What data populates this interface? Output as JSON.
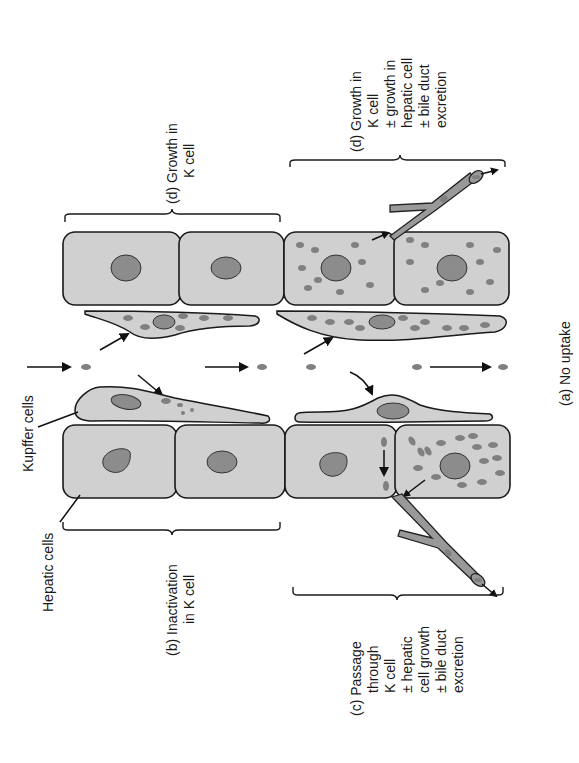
{
  "figure": {
    "orientation": "rotated 90deg counter-clockwise",
    "labels": {
      "kupffer_cells": "Kupffer cells",
      "hepatic_cells": "Hepatic cells",
      "a": "(a)  No uptake",
      "b_line1": "(b)  Inactivation",
      "b_line2": "in K cell",
      "c_line1": "(c)  Passage",
      "c_line2": "through",
      "c_line3": "K cell",
      "c_line4": "± hepatic",
      "c_line5": "cell growth",
      "c_line6": "± bile duct",
      "c_line7": "excretion",
      "d1_line1": "(d) Growth in",
      "d1_line2": "K cell",
      "d2_line1": "(d)  Growth in",
      "d2_line2": "K cell",
      "d2_line3": "± growth in",
      "d2_line4": "hepatic cell",
      "d2_line5": "± bile duct",
      "d2_line6": "excretion"
    },
    "colors": {
      "cell_fill": "#d0d0d0",
      "nucleus": "#8c8c8c",
      "particle": "#808080",
      "outline": "#1a1a1a"
    }
  }
}
